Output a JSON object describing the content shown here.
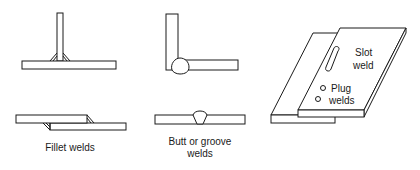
{
  "diagram": {
    "type": "weld-types-illustration",
    "groups": [
      {
        "id": "fillet",
        "label": "Fillet welds",
        "joints": [
          "T-joint with fillet welds",
          "Lap joint with fillet welds"
        ]
      },
      {
        "id": "butt",
        "label_line1": "Butt or groove",
        "label_line2": "welds",
        "joints": [
          "Corner joint with groove weld bead",
          "Butt joint with groove weld bead"
        ]
      },
      {
        "id": "slot-plug",
        "slot_label_line1": "Slot",
        "slot_label_line2": "weld",
        "plug_label_line1": "Plug",
        "plug_label_line2": "welds",
        "joints": [
          "Lap joint with slot weld and two plug welds"
        ]
      }
    ],
    "colors": {
      "line": "#1a1a1a",
      "background": "#ffffff"
    }
  }
}
